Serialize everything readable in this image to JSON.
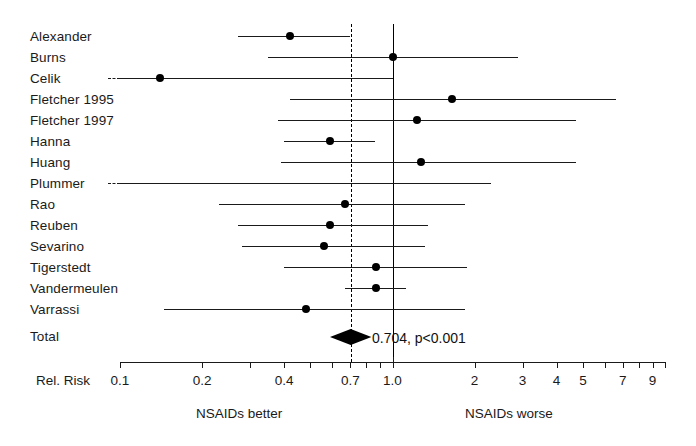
{
  "chart_data": {
    "type": "forest",
    "title": "",
    "xlabel": "Rel. Risk",
    "ylabel": "",
    "scale": "log",
    "xlim": [
      0.1,
      10
    ],
    "grid": false,
    "axis": {
      "label": "Rel. Risk",
      "ticks": [
        {
          "value": 0.1,
          "label": "0.1"
        },
        {
          "value": 0.2,
          "label": "0.2"
        },
        {
          "value": 0.3,
          "label": ""
        },
        {
          "value": 0.4,
          "label": "0.4"
        },
        {
          "value": 0.5,
          "label": ""
        },
        {
          "value": 0.6,
          "label": ""
        },
        {
          "value": 0.7,
          "label": "0.7"
        },
        {
          "value": 0.8,
          "label": ""
        },
        {
          "value": 0.9,
          "label": ""
        },
        {
          "value": 1.0,
          "label": "1.0"
        },
        {
          "value": 2,
          "label": "2"
        },
        {
          "value": 3,
          "label": "3"
        },
        {
          "value": 4,
          "label": "4"
        },
        {
          "value": 5,
          "label": "5"
        },
        {
          "value": 6,
          "label": ""
        },
        {
          "value": 7,
          "label": "7"
        },
        {
          "value": 8,
          "label": ""
        },
        {
          "value": 9,
          "label": "9"
        },
        {
          "value": 10,
          "label": ""
        }
      ]
    },
    "reference_lines": [
      {
        "name": "null-line",
        "value": 1.0,
        "style": "solid"
      },
      {
        "name": "pooled-line",
        "value": 0.704,
        "style": "dashed"
      }
    ],
    "footers": {
      "left": "NSAIDs better",
      "right": "NSAIDs worse"
    },
    "studies": [
      {
        "label": "Alexander",
        "rr": 0.42,
        "lo": 0.27,
        "hi": 0.7,
        "lo_clipped": false,
        "hi_clipped": false
      },
      {
        "label": "Burns",
        "rr": 1.0,
        "lo": 0.35,
        "hi": 2.9,
        "lo_clipped": false,
        "hi_clipped": false
      },
      {
        "label": "Celik",
        "rr": 0.14,
        "lo": 0.1,
        "hi": 1.0,
        "lo_clipped": true,
        "hi_clipped": false
      },
      {
        "label": "Fletcher 1995",
        "rr": 1.66,
        "lo": 0.42,
        "hi": 6.6,
        "lo_clipped": false,
        "hi_clipped": false
      },
      {
        "label": "Fletcher 1997",
        "rr": 1.23,
        "lo": 0.38,
        "hi": 4.7,
        "lo_clipped": false,
        "hi_clipped": false
      },
      {
        "label": "Hanna",
        "rr": 0.59,
        "lo": 0.4,
        "hi": 0.86,
        "lo_clipped": false,
        "hi_clipped": false
      },
      {
        "label": "Huang",
        "rr": 1.27,
        "lo": 0.39,
        "hi": 4.7,
        "lo_clipped": false,
        "hi_clipped": false
      },
      {
        "label": "Plummer",
        "rr": null,
        "lo": 0.1,
        "hi": 2.3,
        "lo_clipped": true,
        "hi_clipped": false
      },
      {
        "label": "Rao",
        "rr": 0.67,
        "lo": 0.23,
        "hi": 1.85,
        "lo_clipped": false,
        "hi_clipped": false
      },
      {
        "label": "Reuben",
        "rr": 0.59,
        "lo": 0.27,
        "hi": 1.35,
        "lo_clipped": false,
        "hi_clipped": false
      },
      {
        "label": "Sevarino",
        "rr": 0.56,
        "lo": 0.28,
        "hi": 1.32,
        "lo_clipped": false,
        "hi_clipped": false
      },
      {
        "label": "Tigerstedt",
        "rr": 0.87,
        "lo": 0.4,
        "hi": 1.88,
        "lo_clipped": false,
        "hi_clipped": false
      },
      {
        "label": "Vandermeulen",
        "rr": 0.87,
        "lo": 0.67,
        "hi": 1.12,
        "lo_clipped": false,
        "hi_clipped": false
      },
      {
        "label": "Varrassi",
        "rr": 0.48,
        "lo": 0.145,
        "hi": 1.84,
        "lo_clipped": false,
        "hi_clipped": false
      }
    ],
    "total": {
      "label": "Total",
      "rr": 0.704,
      "lo": 0.64,
      "hi": 0.78,
      "annotation": "0.704, p<0.001",
      "value_text": "0.704",
      "p_text": "p<0.001"
    }
  }
}
